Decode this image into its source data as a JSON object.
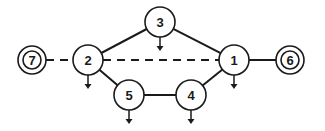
{
  "diagram": {
    "type": "network-graph",
    "colors": {
      "stroke": "#1a1a1a",
      "node_fill": "#ffffff",
      "background": "#ffffff"
    },
    "nodes": [
      {
        "id": "1",
        "label": "1",
        "x": 234,
        "y": 60,
        "r": 15,
        "style": "single",
        "has_down_arrow": true
      },
      {
        "id": "2",
        "label": "2",
        "x": 88,
        "y": 60,
        "r": 15,
        "style": "single",
        "has_down_arrow": true
      },
      {
        "id": "3",
        "label": "3",
        "x": 160,
        "y": 22,
        "r": 15,
        "style": "single",
        "has_down_arrow": true
      },
      {
        "id": "4",
        "label": "4",
        "x": 191,
        "y": 95,
        "r": 15,
        "style": "single",
        "has_down_arrow": true
      },
      {
        "id": "5",
        "label": "5",
        "x": 129,
        "y": 95,
        "r": 15,
        "style": "single",
        "has_down_arrow": true
      },
      {
        "id": "6",
        "label": "6",
        "x": 290,
        "y": 60,
        "r": 14,
        "style": "double",
        "has_down_arrow": false
      },
      {
        "id": "7",
        "label": "7",
        "x": 32,
        "y": 60,
        "r": 14,
        "style": "double",
        "has_down_arrow": false
      }
    ],
    "edges": [
      {
        "from": "2",
        "to": "3",
        "style": "solid"
      },
      {
        "from": "3",
        "to": "1",
        "style": "solid"
      },
      {
        "from": "2",
        "to": "5",
        "style": "solid"
      },
      {
        "from": "5",
        "to": "4",
        "style": "solid"
      },
      {
        "from": "4",
        "to": "1",
        "style": "solid"
      },
      {
        "from": "1",
        "to": "6",
        "style": "solid"
      },
      {
        "from": "7",
        "to": "2",
        "style": "dashed"
      },
      {
        "from": "2",
        "to": "1",
        "style": "dashed"
      }
    ]
  }
}
